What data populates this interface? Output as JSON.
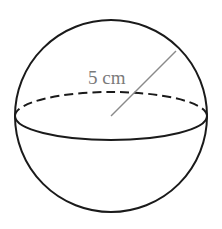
{
  "diagram": {
    "type": "sphere",
    "radius_label": "5 cm",
    "colors": {
      "outline": "#1a1a1a",
      "radius_line": "#8a8a8a",
      "label": "#7a7a7a",
      "background": "#ffffff"
    }
  }
}
